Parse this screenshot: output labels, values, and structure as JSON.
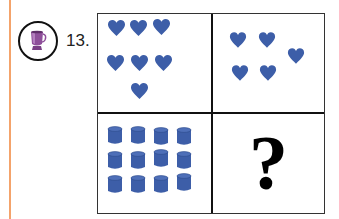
{
  "question": {
    "number_label": "13.",
    "icon": "cup-icon",
    "prompt_symbol": "?"
  },
  "grid": {
    "top_left": {
      "shape": "heart",
      "count": 7
    },
    "top_right": {
      "shape": "heart",
      "count": 5
    },
    "bottom_left": {
      "shape": "cylinder",
      "count": 12
    },
    "bottom_right": {
      "shape": "question-mark",
      "count": null
    }
  },
  "colors": {
    "shape_fill": "#3d5ea8",
    "margin_line": "#f4a36b",
    "cup": "#8e4f9a"
  }
}
